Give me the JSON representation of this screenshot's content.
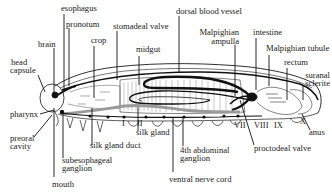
{
  "figure": {
    "labels": {
      "esophagus": "esophagus",
      "pronotum": "pronotum",
      "brain": "brain",
      "crop": "crop",
      "stomadeal_valve": "stomadeal valve",
      "midgut": "midgut",
      "dorsal_blood_vessel": "dorsal blood vessel",
      "malpighian_ampulla_1": "Malpighian",
      "malpighian_ampulla_2": "ampulla",
      "intestine": "intestine",
      "malpighian_tubule": "Malpighian tubule",
      "rectum": "rectum",
      "suranal_sclerite_1": "suranal",
      "suranal_sclerite_2": "sclerite",
      "head_capsule_1": "head",
      "head_capsule_2": "capsule",
      "pharynx": "pharynx",
      "preoral_cavity_1": "preoral",
      "preoral_cavity_2": "cavity",
      "subesophageal_ganglion_1": "subesophageal",
      "subesophageal_ganglion_2": "ganglion",
      "mouth": "mouth",
      "silk_gland_duct": "silk gland duct",
      "silk_gland": "silk gland",
      "abdominal_ganglion_1": "4th abdominal",
      "abdominal_ganglion_2": "ganglion",
      "ventral_nerve_cord": "ventral nerve cord",
      "proctodeal_valve": "proctodeal valve",
      "anus": "anus"
    },
    "segments": [
      "I",
      "II",
      "VII",
      "VIII",
      "IX",
      "X"
    ],
    "colors": {
      "ink": "#1a1a1a",
      "paper": "#ffffff",
      "tissue": "#9a9a9a"
    }
  }
}
